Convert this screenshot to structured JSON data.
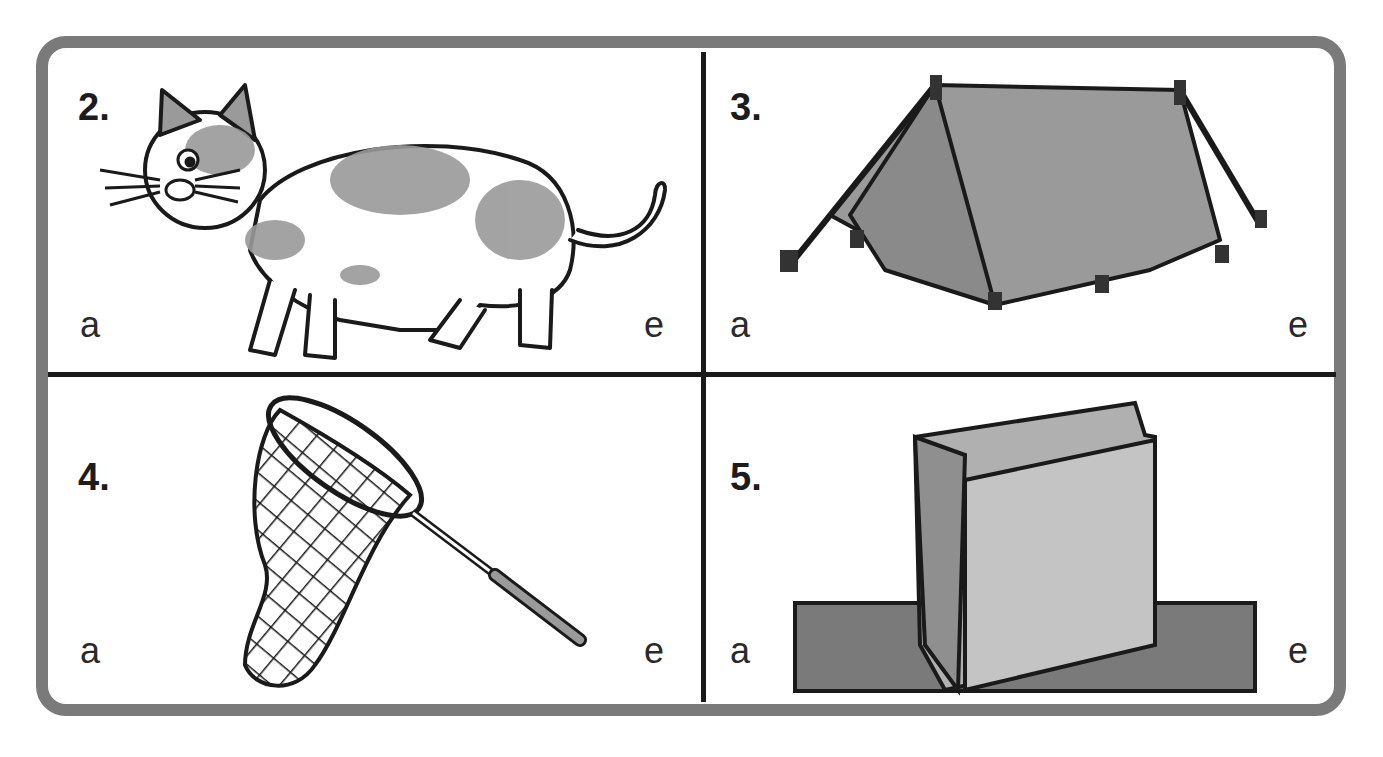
{
  "worksheet": {
    "cells": [
      {
        "number": "2.",
        "picture": "cat",
        "left_letter": "a",
        "right_letter": "e"
      },
      {
        "number": "3.",
        "picture": "tent",
        "left_letter": "a",
        "right_letter": "e"
      },
      {
        "number": "4.",
        "picture": "butterfly-net",
        "left_letter": "a",
        "right_letter": "e"
      },
      {
        "number": "5.",
        "picture": "paper-bag",
        "left_letter": "a",
        "right_letter": "e"
      }
    ]
  },
  "colors": {
    "frame": "#7a7a7a",
    "divider": "#1a1a1a",
    "fill_gray": "#9a9a9a",
    "ink": "#1a1a1a"
  }
}
